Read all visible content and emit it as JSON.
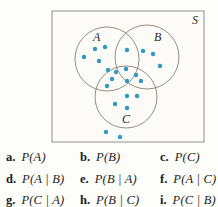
{
  "diagram": {
    "sample_space_label": "S",
    "box": {
      "x": 52,
      "y": 11,
      "width": 152,
      "height": 131
    },
    "sample_space_label_pos": {
      "x": 192,
      "y": 24
    },
    "colors": {
      "dot": "#2d9ac6",
      "circle_stroke": "#7e7064",
      "box_stroke": "#8f8f8f",
      "box_fill": "#fcfbf7",
      "label_text": "#2a2a2a"
    },
    "circles": [
      {
        "label": "A",
        "cx": 107,
        "cy": 59,
        "r": 32,
        "label_x": 93,
        "label_y": 41
      },
      {
        "label": "B",
        "cx": 147,
        "cy": 57,
        "r": 32,
        "label_x": 154,
        "label_y": 41
      },
      {
        "label": "C",
        "cx": 126,
        "cy": 97,
        "r": 31,
        "label_x": 122,
        "label_y": 123
      }
    ],
    "dot_radius": 2.2,
    "dots": [
      {
        "x": 95,
        "y": 49,
        "region": "A"
      },
      {
        "x": 105,
        "y": 47,
        "region": "A"
      },
      {
        "x": 84,
        "y": 57,
        "region": "A"
      },
      {
        "x": 99,
        "y": 61,
        "region": "A"
      },
      {
        "x": 108,
        "y": 70,
        "region": "A"
      },
      {
        "x": 127,
        "y": 50,
        "region": "A∩B"
      },
      {
        "x": 143,
        "y": 51,
        "region": "B"
      },
      {
        "x": 153,
        "y": 54,
        "region": "B"
      },
      {
        "x": 160,
        "y": 66,
        "region": "B"
      },
      {
        "x": 126,
        "y": 69,
        "region": "A∩B∩C"
      },
      {
        "x": 127,
        "y": 81,
        "region": "A∩B∩C"
      },
      {
        "x": 116,
        "y": 72,
        "region": "A∩C"
      },
      {
        "x": 112,
        "y": 79,
        "region": "A∩C"
      },
      {
        "x": 107,
        "y": 86,
        "region": "A∩C"
      },
      {
        "x": 136,
        "y": 75,
        "region": "B∩C"
      },
      {
        "x": 141,
        "y": 81,
        "region": "B∩C"
      },
      {
        "x": 127,
        "y": 96,
        "region": "C"
      },
      {
        "x": 137,
        "y": 96,
        "region": "C"
      },
      {
        "x": 115,
        "y": 104,
        "region": "C"
      },
      {
        "x": 127,
        "y": 108,
        "region": "C"
      },
      {
        "x": 106,
        "y": 132,
        "region": "S"
      },
      {
        "x": 120,
        "y": 137,
        "region": "S"
      }
    ]
  },
  "items": [
    {
      "letter": "a.",
      "expr": "P(A)"
    },
    {
      "letter": "b.",
      "expr": "P(B)"
    },
    {
      "letter": "c.",
      "expr": "P(C)"
    },
    {
      "letter": "d.",
      "expr": "P(A | B)"
    },
    {
      "letter": "e.",
      "expr": "P(B | A)"
    },
    {
      "letter": "f.",
      "expr": "P(A | C)"
    },
    {
      "letter": "g.",
      "expr": "P(C | A)"
    },
    {
      "letter": "h.",
      "expr": "P(B | C)"
    },
    {
      "letter": "i.",
      "expr": "P(C | B)"
    }
  ]
}
